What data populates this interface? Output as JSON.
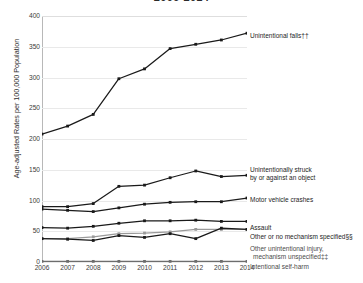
{
  "title": "2006-2014",
  "chart_data": {
    "type": "line",
    "title": "2006-2014",
    "xlabel": "",
    "ylabel": "Age-adjusted Rates per 100,000 Population",
    "x": [
      2006,
      2007,
      2008,
      2009,
      2010,
      2011,
      2012,
      2013,
      2014
    ],
    "xlim": [
      2006,
      2014
    ],
    "ylim": [
      0,
      400
    ],
    "yticks": [
      0,
      50,
      100,
      150,
      200,
      250,
      300,
      350,
      400
    ],
    "xticks": [
      "2006",
      "2007",
      "2008",
      "2009",
      "2010",
      "2011",
      "2012",
      "2013",
      "2014"
    ],
    "grid": true,
    "legend_position": "right-inline-end-of-line",
    "series": [
      {
        "name": "Unintentional falls††",
        "color": "#1a1a1a",
        "values": [
          208,
          221,
          240,
          298,
          314,
          347,
          354,
          361,
          372
        ]
      },
      {
        "name": "Unintentionally struck by or against an object",
        "color": "#1a1a1a",
        "values": [
          90,
          90,
          95,
          123,
          125,
          137,
          148,
          139,
          141
        ]
      },
      {
        "name": "Motor vehicle crashes",
        "color": "#1a1a1a",
        "values": [
          86,
          84,
          82,
          88,
          94,
          97,
          98,
          98,
          104
        ]
      },
      {
        "name": "Assault",
        "color": "#1a1a1a",
        "values": [
          56,
          55,
          58,
          63,
          67,
          67,
          68,
          66,
          66
        ]
      },
      {
        "name": "Other or no mechanism specified§§",
        "color": "#9a9a9a",
        "values": [
          38,
          38,
          41,
          46,
          47,
          49,
          53,
          53,
          53
        ]
      },
      {
        "name": "Other unintentional injury, mechanism unspecified‡‡",
        "color": "#1a1a1a",
        "values": [
          38,
          37,
          35,
          43,
          40,
          46,
          38,
          55,
          53
        ]
      },
      {
        "name": "Intentional self-harm",
        "color": "#6d6d6d",
        "values": [
          1,
          1,
          1,
          1,
          1,
          1,
          1,
          1,
          1
        ]
      }
    ],
    "annotations": [
      {
        "id": "falls",
        "text": "Unintentional falls††"
      },
      {
        "id": "struck-1",
        "text": "Unintentionally struck"
      },
      {
        "id": "struck-2",
        "text": "by or against an object"
      },
      {
        "id": "motor",
        "text": "Motor vehicle crashes"
      },
      {
        "id": "assault",
        "text": "Assault"
      },
      {
        "id": "other-spec",
        "text": "Other or no mechanism specified§§"
      },
      {
        "id": "other-unint-1",
        "text": "Other unintentional injury,"
      },
      {
        "id": "other-unint-2",
        "text": "mechanism unspecified‡‡"
      },
      {
        "id": "selfharm",
        "text": "Intentional self-harm"
      }
    ]
  }
}
